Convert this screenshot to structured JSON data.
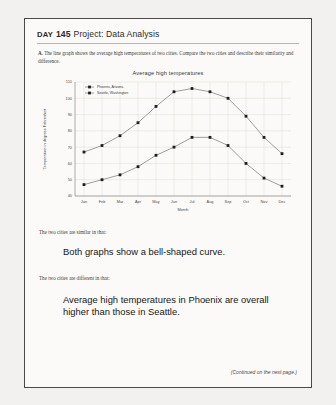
{
  "page": {
    "day_label": "Day",
    "day_number": "145",
    "title_rest": "Project: Data Analysis",
    "prompt_marker": "A.",
    "prompt_text": "The line graph shows the average high temperatures of two cities. Compare the two cities and describe their similarity and difference.",
    "footer_note": "(Continued on the next page.)"
  },
  "chart_data": {
    "type": "line",
    "title": "Average high temperatures",
    "xlabel": "Month",
    "ylabel": "Temperature in degrees Fahrenheit",
    "categories": [
      "Jan",
      "Feb",
      "Mar",
      "Apr",
      "May",
      "Jun",
      "Jul",
      "Aug",
      "Sep",
      "Oct",
      "Nov",
      "Dec"
    ],
    "ylim": [
      40,
      110
    ],
    "yticks": [
      40,
      50,
      60,
      70,
      80,
      90,
      100,
      110
    ],
    "grid": true,
    "legend_position": "top-left",
    "series": [
      {
        "name": "Phoenix, Arizona",
        "values": [
          67,
          71,
          77,
          85,
          95,
          104,
          106,
          104,
          100,
          89,
          76,
          66
        ]
      },
      {
        "name": "Seattle, Washington",
        "values": [
          47,
          50,
          53,
          58,
          65,
          70,
          76,
          76,
          71,
          60,
          51,
          46
        ]
      }
    ]
  },
  "answers": {
    "similar_lead_in": "The two cities are similar in that:",
    "similar_text": "Both graphs show a bell-shaped curve.",
    "different_lead_in": "The two cities are different in that:",
    "different_text": "Average high temperatures in Phoenix are overall higher than those in Seattle."
  }
}
